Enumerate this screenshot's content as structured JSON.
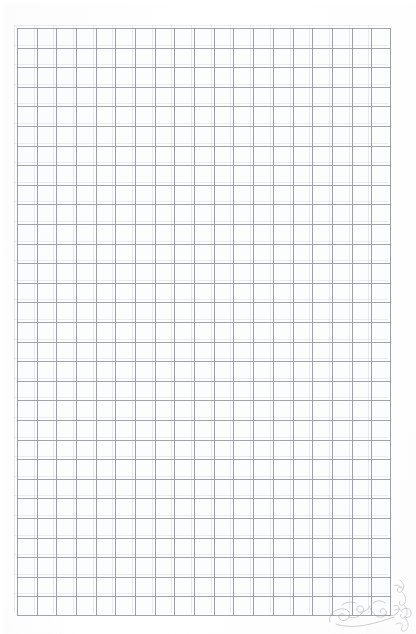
{
  "image": {
    "subject": "blank ruled graph paper sheet (scanned)",
    "background_color": "#fdfdfd",
    "width": 416,
    "height": 634
  },
  "grid": {
    "name": "graph-paper-grid",
    "columns": 19,
    "rows": 30,
    "cell_width_px": 19.68,
    "cell_height_px": 19.6,
    "origin_x_px": 17,
    "origin_y_px": 28,
    "block_width_px": 374,
    "block_height_px": 588,
    "line_color": "#96989f",
    "ghost_line_color": "#babec8",
    "line_weight_px": 1,
    "has_text": false,
    "has_labels": false,
    "content": "empty"
  },
  "annotations": {
    "pencil_mark": {
      "name": "pencil-scribble",
      "location": "bottom-right corner",
      "legible_text": "",
      "description": "faint illegible pencil squiggle / doodle",
      "color": "#8e8e96"
    },
    "pencil_mark_edge": {
      "name": "pencil-scribble-edge",
      "location": "right edge, lower portion",
      "legible_text": "",
      "description": "faint vertical pencil squiggle running up the right margin",
      "color": "#8e8e96"
    }
  }
}
